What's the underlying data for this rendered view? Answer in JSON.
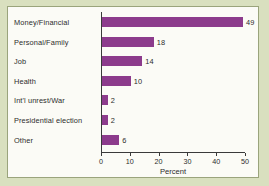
{
  "chart_data": {
    "type": "bar",
    "orientation": "horizontal",
    "title": "",
    "subtitle": "",
    "xlabel": "Percent",
    "ylabel": "",
    "categories": [
      "Money/Financial",
      "Personal/Family",
      "Job",
      "Health",
      "Int'l unrest/War",
      "Presidential election",
      "Other"
    ],
    "values": [
      49,
      18,
      14,
      10,
      2,
      2,
      6
    ],
    "value_labels": [
      "49",
      "18",
      "14",
      "10",
      "2",
      "2",
      "6"
    ],
    "xlim": [
      0,
      50
    ],
    "xticks": [
      0,
      10,
      20,
      30,
      40,
      50
    ],
    "xtick_labels": [
      "0",
      "10",
      "20",
      "30",
      "40",
      "50"
    ],
    "grid": false,
    "legend": false,
    "legend_position": "none",
    "bar_color": "#8c3b8c",
    "axis_color": "#3a3a3a",
    "plot_background": "#fbfbf6",
    "figure_background": "#d9e0bf",
    "border_color": "#9aa47c"
  }
}
